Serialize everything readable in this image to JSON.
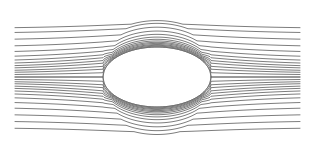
{
  "diagram": {
    "type": "streamlines-around-elliptical-body",
    "background": "#ffffff",
    "stroke_color": "#6e6e6e",
    "stroke_width": 0.9,
    "x_start": 15,
    "x_end": 300,
    "center": {
      "x": 157,
      "y": 77
    },
    "body": {
      "half_length": 54,
      "half_height": 30
    },
    "upstream_offsets": [
      -50,
      -43,
      -36,
      -29,
      -23,
      -18,
      -14,
      -11,
      -8.5,
      -6.5,
      -4.5,
      -3,
      -1.5,
      0,
      1.5,
      3,
      4.5,
      6.5,
      8.5,
      11,
      14,
      18,
      23,
      29,
      36,
      43,
      48
    ]
  }
}
